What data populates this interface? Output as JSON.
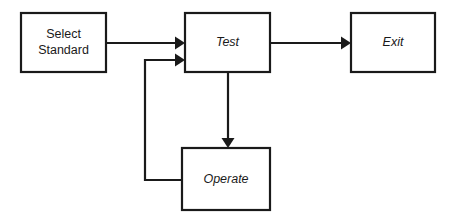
{
  "diagram": {
    "type": "flowchart",
    "title": "",
    "background_color": "#ffffff",
    "line_color": "#1a1a1a",
    "nodes": [
      {
        "id": "select-standard",
        "label_line1": "Select",
        "label_line2": "Standard",
        "style": "plain",
        "shape": "rectangle"
      },
      {
        "id": "test",
        "label": "Test",
        "style": "italic",
        "shape": "rectangle"
      },
      {
        "id": "exit",
        "label": "Exit",
        "style": "italic",
        "shape": "rectangle"
      },
      {
        "id": "operate",
        "label": "Operate",
        "style": "italic",
        "shape": "rectangle"
      }
    ],
    "edges": [
      {
        "id": "select-standard-to-test",
        "from": "select-standard",
        "to": "test",
        "label": "",
        "arrow": true
      },
      {
        "id": "test-to-exit",
        "from": "test",
        "to": "exit",
        "label": "",
        "arrow": true
      },
      {
        "id": "test-to-operate",
        "from": "test",
        "to": "operate",
        "label": "",
        "arrow": true
      },
      {
        "id": "operate-to-test",
        "from": "operate",
        "to": "test",
        "label": "",
        "arrow": true
      }
    ]
  }
}
